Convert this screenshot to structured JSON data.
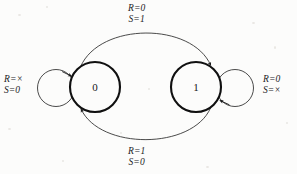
{
  "figure": {
    "kind": "state-transition-diagram",
    "background_color": "#fcfcfb",
    "ink_color": "#161616"
  },
  "states": [
    {
      "id": "state-0",
      "label": "0",
      "cx": 95,
      "cy": 87,
      "r": 25
    },
    {
      "id": "state-1",
      "label": "1",
      "cx": 196,
      "cy": 87,
      "r": 25
    }
  ],
  "transitions": {
    "top": {
      "name": "zero-to-one",
      "from": "0",
      "to": "1",
      "line1": "R=0",
      "line2": "S=1"
    },
    "bottom": {
      "name": "one-to-zero",
      "from": "1",
      "to": "0",
      "line1": "R=1",
      "line2": "S=0"
    },
    "left_self": {
      "name": "zero-self-loop",
      "from": "0",
      "to": "0",
      "line1": "R=×",
      "line2": "S=0"
    },
    "right_self": {
      "name": "one-self-loop",
      "from": "1",
      "to": "1",
      "line1": "R=0",
      "line2": "S=×"
    }
  }
}
